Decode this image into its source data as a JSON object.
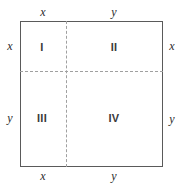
{
  "figure": {
    "type": "geometry-diagram",
    "width": 181,
    "height": 185
  },
  "colors": {
    "background": "#ffffff",
    "outline": "#5a5a5a",
    "divider": "#a0a0a0",
    "label_text": "#2b2b2b",
    "numeral_text": "#3a3a3a"
  },
  "quadrants": [
    {
      "id": "I",
      "label": "I",
      "position": "top-left",
      "width_label": "x",
      "height_label": "x"
    },
    {
      "id": "II",
      "label": "II",
      "position": "top-right",
      "width_label": "y",
      "height_label": "x"
    },
    {
      "id": "III",
      "label": "III",
      "position": "bottom-left",
      "width_label": "x",
      "height_label": "y"
    },
    {
      "id": "IV",
      "label": "IV",
      "position": "bottom-right",
      "width_label": "y",
      "height_label": "y"
    }
  ],
  "edge_labels": {
    "top": {
      "left": "x",
      "right": "y"
    },
    "bottom": {
      "left": "x",
      "right": "y"
    },
    "left": {
      "upper": "x",
      "lower": "y"
    },
    "right": {
      "upper": "x",
      "lower": "y"
    }
  },
  "chart_data": {
    "type": "diagram",
    "title": "",
    "square_side_segments": [
      "x",
      "y"
    ],
    "regions": [
      {
        "name": "I",
        "width": "x",
        "height": "x",
        "area": "x^2"
      },
      {
        "name": "II",
        "width": "y",
        "height": "x",
        "area": "xy"
      },
      {
        "name": "III",
        "width": "x",
        "height": "y",
        "area": "xy"
      },
      {
        "name": "IV",
        "width": "y",
        "height": "y",
        "area": "y^2"
      }
    ]
  }
}
